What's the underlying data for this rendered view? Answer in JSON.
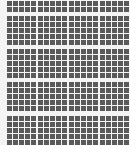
{
  "grid": {
    "tile_color": "#5a5a5a",
    "background_color": "#f4f4f4",
    "tile_size": 5,
    "tile_gap": 1,
    "columns_per_block": 5,
    "block_columns_x": [
      7,
      38,
      69,
      100
    ],
    "block_rows": [
      {
        "y": 1,
        "tile_rows": 2
      },
      {
        "y": 16,
        "tile_rows": 5
      },
      {
        "y": 49,
        "tile_rows": 5
      },
      {
        "y": 82,
        "tile_rows": 5
      },
      {
        "y": 116,
        "tile_rows": 5
      }
    ]
  }
}
